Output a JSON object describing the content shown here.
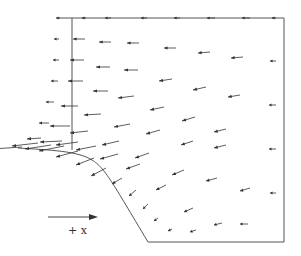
{
  "diagram": {
    "type": "vector-field",
    "direction_label": "+ x",
    "line_color": "#444444",
    "arrow_color": "#333333",
    "vectors": [
      {
        "x": 60,
        "y": 18,
        "dx": -4,
        "dy": 0
      },
      {
        "x": 86,
        "y": 18,
        "dx": -4,
        "dy": 0
      },
      {
        "x": 111,
        "y": 18,
        "dx": -6,
        "dy": 0
      },
      {
        "x": 147,
        "y": 18,
        "dx": -6,
        "dy": 0
      },
      {
        "x": 180,
        "y": 18,
        "dx": -6,
        "dy": 0
      },
      {
        "x": 215,
        "y": 18,
        "dx": -8,
        "dy": 0
      },
      {
        "x": 250,
        "y": 18,
        "dx": -8,
        "dy": 0
      },
      {
        "x": 276,
        "y": 18,
        "dx": -4,
        "dy": 0
      },
      {
        "x": 59,
        "y": 39,
        "dx": -5,
        "dy": 0
      },
      {
        "x": 85,
        "y": 39,
        "dx": -12,
        "dy": 0
      },
      {
        "x": 111,
        "y": 42,
        "dx": -12,
        "dy": 0
      },
      {
        "x": 139,
        "y": 43,
        "dx": -12,
        "dy": 0
      },
      {
        "x": 176,
        "y": 48,
        "dx": -12,
        "dy": 0
      },
      {
        "x": 210,
        "y": 52,
        "dx": -12,
        "dy": 1
      },
      {
        "x": 243,
        "y": 57,
        "dx": -12,
        "dy": 1
      },
      {
        "x": 276,
        "y": 61,
        "dx": -6,
        "dy": 0
      },
      {
        "x": 59,
        "y": 60,
        "dx": -6,
        "dy": 0
      },
      {
        "x": 84,
        "y": 60,
        "dx": -14,
        "dy": 0
      },
      {
        "x": 110,
        "y": 67,
        "dx": -14,
        "dy": 0
      },
      {
        "x": 138,
        "y": 70,
        "dx": -14,
        "dy": 0
      },
      {
        "x": 172,
        "y": 79,
        "dx": -13,
        "dy": 2
      },
      {
        "x": 206,
        "y": 87,
        "dx": -13,
        "dy": 3
      },
      {
        "x": 240,
        "y": 95,
        "dx": -12,
        "dy": 2
      },
      {
        "x": 276,
        "y": 105,
        "dx": -7,
        "dy": 0
      },
      {
        "x": 58,
        "y": 81,
        "dx": -7,
        "dy": 0
      },
      {
        "x": 83,
        "y": 81,
        "dx": -15,
        "dy": 0
      },
      {
        "x": 108,
        "y": 91,
        "dx": -15,
        "dy": 0
      },
      {
        "x": 134,
        "y": 96,
        "dx": -16,
        "dy": 2
      },
      {
        "x": 164,
        "y": 107,
        "dx": -14,
        "dy": 3
      },
      {
        "x": 195,
        "y": 117,
        "dx": -13,
        "dy": 4
      },
      {
        "x": 226,
        "y": 129,
        "dx": -12,
        "dy": 3
      },
      {
        "x": 276,
        "y": 149,
        "dx": -7,
        "dy": 0
      },
      {
        "x": 54,
        "y": 102,
        "dx": -8,
        "dy": 0
      },
      {
        "x": 78,
        "y": 106,
        "dx": -17,
        "dy": 0
      },
      {
        "x": 101,
        "y": 114,
        "dx": -17,
        "dy": 1
      },
      {
        "x": 130,
        "y": 124,
        "dx": -16,
        "dy": 3
      },
      {
        "x": 160,
        "y": 130,
        "dx": -14,
        "dy": 4
      },
      {
        "x": 193,
        "y": 141,
        "dx": -12,
        "dy": 4
      },
      {
        "x": 226,
        "y": 145,
        "dx": -12,
        "dy": 3
      },
      {
        "x": 276,
        "y": 193,
        "dx": -6,
        "dy": 0
      },
      {
        "x": 49,
        "y": 123,
        "dx": -10,
        "dy": 0
      },
      {
        "x": 70,
        "y": 126,
        "dx": -20,
        "dy": 0
      },
      {
        "x": 88,
        "y": 131,
        "dx": -18,
        "dy": 2
      },
      {
        "x": 119,
        "y": 141,
        "dx": -17,
        "dy": 4
      },
      {
        "x": 149,
        "y": 153,
        "dx": -14,
        "dy": 5
      },
      {
        "x": 184,
        "y": 170,
        "dx": -12,
        "dy": 5
      },
      {
        "x": 217,
        "y": 178,
        "dx": -11,
        "dy": 3
      },
      {
        "x": 250,
        "y": 188,
        "dx": -10,
        "dy": 3
      },
      {
        "x": 41,
        "y": 138,
        "dx": -14,
        "dy": 1
      },
      {
        "x": 62,
        "y": 141,
        "dx": -22,
        "dy": 1
      },
      {
        "x": 78,
        "y": 142,
        "dx": -22,
        "dy": 3
      },
      {
        "x": 96,
        "y": 146,
        "dx": -20,
        "dy": 4
      },
      {
        "x": 118,
        "y": 154,
        "dx": -18,
        "dy": 5
      },
      {
        "x": 140,
        "y": 164,
        "dx": -14,
        "dy": 5
      },
      {
        "x": 166,
        "y": 185,
        "dx": -10,
        "dy": 5
      },
      {
        "x": 193,
        "y": 208,
        "dx": -9,
        "dy": 4
      },
      {
        "x": 222,
        "y": 223,
        "dx": -8,
        "dy": 2
      },
      {
        "x": 248,
        "y": 224,
        "dx": -8,
        "dy": 0
      },
      {
        "x": 22,
        "y": 147,
        "dx": -30,
        "dy": 2
      },
      {
        "x": 38,
        "y": 143,
        "dx": -26,
        "dy": 3
      },
      {
        "x": 51,
        "y": 145,
        "dx": -26,
        "dy": 4
      },
      {
        "x": 64,
        "y": 146,
        "dx": -25,
        "dy": 5
      },
      {
        "x": 78,
        "y": 151,
        "dx": -22,
        "dy": 6
      },
      {
        "x": 94,
        "y": 158,
        "dx": -18,
        "dy": 7
      },
      {
        "x": 106,
        "y": 168,
        "dx": -15,
        "dy": 8
      },
      {
        "x": 122,
        "y": 178,
        "dx": -10,
        "dy": 6
      },
      {
        "x": 136,
        "y": 190,
        "dx": -7,
        "dy": 6
      },
      {
        "x": 148,
        "y": 204,
        "dx": -5,
        "dy": 5
      },
      {
        "x": 158,
        "y": 218,
        "dx": -4,
        "dy": 3
      },
      {
        "x": 172,
        "y": 229,
        "dx": -4,
        "dy": 2
      },
      {
        "x": 196,
        "y": 230,
        "dx": -6,
        "dy": 2
      }
    ]
  }
}
